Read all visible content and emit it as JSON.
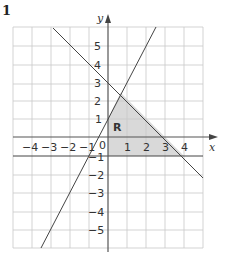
{
  "question_number": "1",
  "region_label": "R",
  "axes": {
    "x_label": "x",
    "y_label": "y",
    "x_ticks": [
      "−4",
      "−3",
      "−2",
      "−1",
      "0",
      "1",
      "2",
      "3",
      "4"
    ],
    "y_ticks_positive": [
      "5",
      "4",
      "3",
      "2",
      "1"
    ],
    "y_ticks_negative": [
      "−1",
      "−2",
      "−3",
      "−4",
      "−5"
    ]
  },
  "lines": [
    {
      "equation": "y = -x + 3"
    },
    {
      "equation": "y = 2x + 1"
    },
    {
      "equation": "y = -1"
    },
    {
      "equation": "x = 0"
    }
  ],
  "colors": {
    "grid": "#c8c8c8",
    "axis": "#555555",
    "line": "#444444",
    "shade": "#d9d9d9"
  }
}
